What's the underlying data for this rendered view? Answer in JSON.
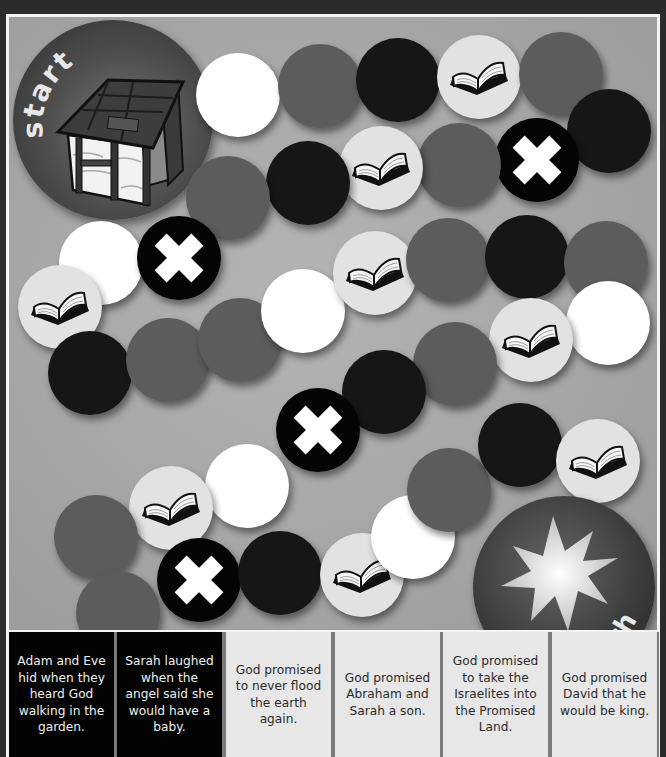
{
  "board": {
    "background_color": "#a8a8a8",
    "frame_color": "#2b2b2b",
    "start": {
      "label": "start",
      "icon": "stable-house-icon",
      "center": [
        104,
        103
      ]
    },
    "finish": {
      "label": "finish",
      "icon": "starburst-icon",
      "center": [
        555,
        570
      ]
    },
    "space_colors": {
      "white": "#ffffff",
      "gray": "#5c5c5c",
      "black": "#161616",
      "book": "#e2e2e2",
      "x": "#050505"
    },
    "spaces": [
      {
        "type": "white",
        "x": 229,
        "y": 78
      },
      {
        "type": "gray",
        "x": 311,
        "y": 69
      },
      {
        "type": "black",
        "x": 389,
        "y": 63
      },
      {
        "type": "book",
        "x": 470,
        "y": 60
      },
      {
        "type": "gray",
        "x": 552,
        "y": 57
      },
      {
        "type": "black",
        "x": 600,
        "y": 114
      },
      {
        "type": "x",
        "x": 528,
        "y": 143
      },
      {
        "type": "gray",
        "x": 450,
        "y": 148
      },
      {
        "type": "book",
        "x": 372,
        "y": 151
      },
      {
        "type": "black",
        "x": 299,
        "y": 166
      },
      {
        "type": "gray",
        "x": 219,
        "y": 181
      },
      {
        "type": "white",
        "x": 92,
        "y": 246
      },
      {
        "type": "x",
        "x": 170,
        "y": 241
      },
      {
        "type": "book",
        "x": 51,
        "y": 290
      },
      {
        "type": "black",
        "x": 81,
        "y": 356
      },
      {
        "type": "gray",
        "x": 159,
        "y": 343
      },
      {
        "type": "gray",
        "x": 231,
        "y": 323
      },
      {
        "type": "white",
        "x": 294,
        "y": 294
      },
      {
        "type": "book",
        "x": 366,
        "y": 256
      },
      {
        "type": "gray",
        "x": 439,
        "y": 243
      },
      {
        "type": "black",
        "x": 518,
        "y": 240
      },
      {
        "type": "gray",
        "x": 597,
        "y": 246
      },
      {
        "type": "white",
        "x": 599,
        "y": 306
      },
      {
        "type": "book",
        "x": 522,
        "y": 323
      },
      {
        "type": "gray",
        "x": 446,
        "y": 347
      },
      {
        "type": "black",
        "x": 375,
        "y": 375
      },
      {
        "type": "x",
        "x": 309,
        "y": 413
      },
      {
        "type": "white",
        "x": 238,
        "y": 469
      },
      {
        "type": "book",
        "x": 162,
        "y": 491
      },
      {
        "type": "gray",
        "x": 87,
        "y": 520
      },
      {
        "type": "gray",
        "x": 109,
        "y": 596
      },
      {
        "type": "x",
        "x": 190,
        "y": 563
      },
      {
        "type": "black",
        "x": 271,
        "y": 556
      },
      {
        "type": "book",
        "x": 353,
        "y": 558
      },
      {
        "type": "white",
        "x": 404,
        "y": 520
      },
      {
        "type": "gray",
        "x": 440,
        "y": 473
      },
      {
        "type": "black",
        "x": 511,
        "y": 428
      },
      {
        "type": "book",
        "x": 589,
        "y": 444
      }
    ]
  },
  "cards": [
    {
      "text": "Adam and Eve hid when they heard God walking in the garden.",
      "style": "dark"
    },
    {
      "text": "Sarah laughed when the angel said she would have a baby.",
      "style": "dark"
    },
    {
      "text": "God promised to never flood the earth again.",
      "style": "light"
    },
    {
      "text": "God promised Abraham and Sarah a son.",
      "style": "light"
    },
    {
      "text": "God promised to take the Israelites into the Promised Land.",
      "style": "light"
    },
    {
      "text": "God promised David that he would be king.",
      "style": "light"
    }
  ]
}
